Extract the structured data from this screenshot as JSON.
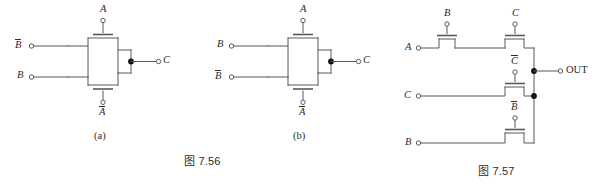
{
  "page": {
    "kind": "textbook-figure-pair",
    "width": 599,
    "height": 187,
    "background": "#ffffff",
    "ink": "#555a5e",
    "text_color": "#2b2b2b",
    "junction_color": "#111111"
  },
  "figures": [
    {
      "id": "fig-7-56",
      "caption": "图 7.56",
      "subfigures": [
        {
          "id": "subfig-a",
          "sublabel": "(a)",
          "description": "two pass transistors merged at a common node driving output C",
          "gate_labels": {
            "top": "A",
            "bottom": "A",
            "bottom_overbar": true,
            "top_overbar": false
          },
          "input_labels": [
            {
              "name": "B",
              "overbar": true,
              "position": "upper-left"
            },
            {
              "name": "B",
              "overbar": false,
              "position": "lower-left"
            }
          ],
          "output_label": {
            "name": "C",
            "overbar": false,
            "position": "right"
          }
        },
        {
          "id": "subfig-b",
          "sublabel": "(b)",
          "description": "same topology as (a) with the two data inputs exchanged",
          "gate_labels": {
            "top": "A",
            "bottom": "A",
            "bottom_overbar": true,
            "top_overbar": false
          },
          "input_labels": [
            {
              "name": "B",
              "overbar": false,
              "position": "upper-left"
            },
            {
              "name": "B",
              "overbar": true,
              "position": "lower-left"
            }
          ],
          "output_label": {
            "name": "C",
            "overbar": false,
            "position": "right"
          }
        }
      ]
    },
    {
      "id": "fig-7-57",
      "caption": "图 7.57",
      "subfigures": [
        {
          "id": "subfig-c",
          "sublabel": "",
          "description": "four pass transistors; three data inputs on the left, common output bus on the right",
          "gate_labels_top_to_bottom": [
            {
              "name": "B",
              "overbar": false
            },
            {
              "name": "C",
              "overbar": false
            },
            {
              "name": "C",
              "overbar": true
            },
            {
              "name": "B",
              "overbar": true
            }
          ],
          "input_labels": [
            {
              "name": "A",
              "overbar": false,
              "position": "row-1-left"
            },
            {
              "name": "C",
              "overbar": false,
              "position": "row-2-left"
            },
            {
              "name": "B",
              "overbar": false,
              "position": "row-3-left"
            }
          ],
          "output_label": {
            "name": "OUT",
            "overbar": false,
            "position": "right"
          }
        }
      ]
    }
  ],
  "labels": {
    "a": {
      "gate_top": "A",
      "gate_bottom": "A",
      "in_top": "B",
      "in_bottom": "B",
      "out": "C",
      "sub": "(a)"
    },
    "b": {
      "gate_top": "A",
      "gate_bottom": "A",
      "in_top": "B",
      "in_bottom": "B",
      "out": "C",
      "sub": "(b)"
    },
    "c": {
      "gate_1": "B",
      "gate_2": "C",
      "gate_3": "C",
      "gate_4": "B",
      "in_1": "A",
      "in_2": "C",
      "in_3": "B",
      "out": "OUT"
    }
  },
  "captions": {
    "left": "图 7.56",
    "right": "图 7.57"
  }
}
